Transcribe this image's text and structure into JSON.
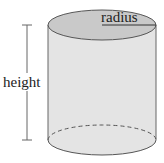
{
  "diagram": {
    "type": "cylinder",
    "labels": {
      "radius": "radius",
      "height": "height"
    },
    "colors": {
      "top_fill": "#c9c9c9",
      "body_fill": "#e4e4e4",
      "stroke": "#555555",
      "dimension_line": "#666666"
    }
  }
}
